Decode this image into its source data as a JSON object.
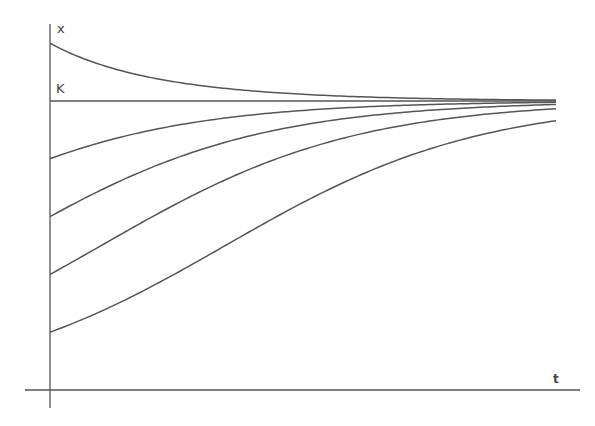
{
  "chart_data": {
    "type": "line",
    "title": "",
    "xlabel": "t",
    "ylabel": "x",
    "annotations": [
      {
        "text": "K",
        "y": 1.0,
        "description": "carrying capacity"
      }
    ],
    "model": "logistic: x(t) = K / (1 + ((K - x0)/x0) * exp(-r t))",
    "K": 1.0,
    "rT": 4.0,
    "t_range": [
      0,
      1
    ],
    "ylim": [
      0,
      1.2
    ],
    "grid": false,
    "legend": null,
    "series": [
      {
        "name": "x0 above K",
        "x0": 1.2
      },
      {
        "name": "x0 = K",
        "x0": 1.0
      },
      {
        "name": "x0 = 0.8K",
        "x0": 0.8
      },
      {
        "name": "x0 = 0.6K",
        "x0": 0.6
      },
      {
        "name": "x0 = 0.4K",
        "x0": 0.4
      },
      {
        "name": "x0 = 0.2K",
        "x0": 0.2
      }
    ]
  },
  "labels": {
    "y_axis": "x",
    "x_axis": "t",
    "k_line": "K"
  }
}
